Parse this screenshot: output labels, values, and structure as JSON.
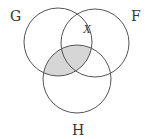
{
  "diagram": {
    "type": "venn",
    "sets": [
      {
        "id": "G",
        "label": "G",
        "cx": 58,
        "cy": 42,
        "r": 34,
        "label_x": 10,
        "label_y": 21
      },
      {
        "id": "F",
        "label": "F",
        "cx": 95,
        "cy": 43,
        "r": 34,
        "label_x": 131,
        "label_y": 21
      },
      {
        "id": "H",
        "label": "H",
        "cx": 77,
        "cy": 79,
        "r": 34,
        "label_x": 72,
        "label_y": 135
      }
    ],
    "marker": {
      "label": "X",
      "x": 83,
      "y": 33
    },
    "shaded_region": "G ∩ H",
    "colors": {
      "stroke": "#555555",
      "shade": "#d6d6d6",
      "background": "#ffffff"
    }
  }
}
